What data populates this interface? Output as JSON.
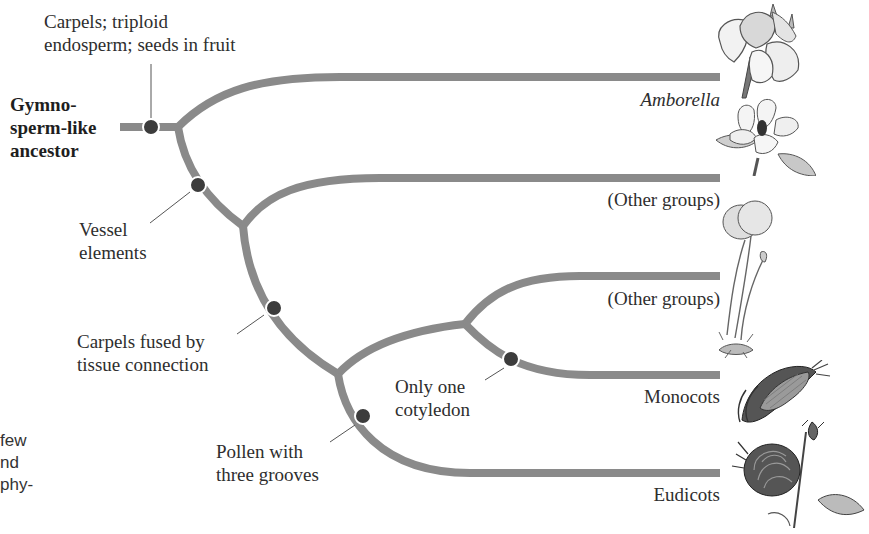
{
  "figure": {
    "type": "phylogenetic-tree",
    "root": {
      "label_lines": [
        "Gymno-",
        "sperm-like",
        "ancestor"
      ]
    },
    "characters": [
      {
        "id": "c1",
        "lines": [
          "Carpels; triploid",
          "endosperm; seeds in fruit"
        ]
      },
      {
        "id": "c2",
        "lines": [
          "Vessel",
          "elements"
        ]
      },
      {
        "id": "c3",
        "lines": [
          "Carpels fused by",
          "tissue connection"
        ]
      },
      {
        "id": "c4",
        "lines": [
          "Only one",
          "cotyledon"
        ]
      },
      {
        "id": "c5",
        "lines": [
          "Pollen with",
          "three grooves"
        ]
      }
    ],
    "taxa": [
      {
        "id": "t1",
        "label": "Amborella",
        "italic": true,
        "illustration": "amborella-flower"
      },
      {
        "id": "t2",
        "label": "(Other groups)",
        "italic": false,
        "illustration": "magnolia-flower"
      },
      {
        "id": "t3",
        "label": "(Other groups)",
        "italic": false,
        "illustration": "water-lily-plant"
      },
      {
        "id": "t4",
        "label": "Monocots",
        "italic": false,
        "illustration": "corn-ear"
      },
      {
        "id": "t5",
        "label": "Eudicots",
        "italic": false,
        "illustration": "rose-flower"
      }
    ],
    "colors": {
      "branch": "#8a8a8a",
      "node": "#3c3c3c",
      "text": "#2e2e2e"
    }
  },
  "margin_fragments": [
    "few",
    "nd",
    "phy-"
  ]
}
